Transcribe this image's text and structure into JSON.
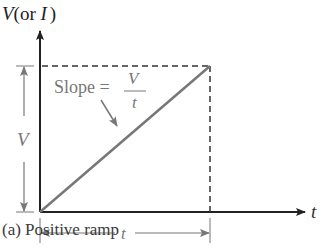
{
  "diagram": {
    "axis_y_label_var": "V",
    "axis_y_label_rest_open": "(or ",
    "axis_y_label_alt": "I",
    "axis_y_label_close": ")",
    "axis_x_label": "t",
    "slope_label": "Slope =",
    "slope_numerator": "V",
    "slope_denominator": "t",
    "height_dimension_label": "V",
    "width_dimension_label": "t",
    "caption": "(a)  Positive ramp",
    "colors": {
      "axis": "#222222",
      "ramp": "#777777",
      "dashed": "#333333",
      "dimension": "#777777",
      "text": "#3a3a3a"
    }
  }
}
